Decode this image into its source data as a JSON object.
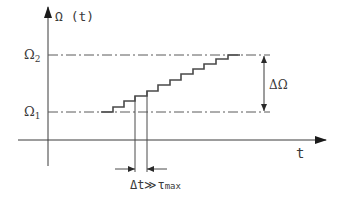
{
  "diagram": {
    "y_axis_label": "Ω (t)",
    "x_axis_label": "t",
    "level_high_label": "Ω",
    "level_high_sub": "2",
    "level_low_label": "Ω",
    "level_low_sub": "1",
    "delta_omega_label": "ΔΩ",
    "delta_t_label": "Δt≫τ",
    "delta_t_sub": "max",
    "staircase_steps": 11,
    "colors": {
      "line": "#3a3a3a",
      "dash": "#5a5a5a",
      "staircase": "#4a4a4a"
    }
  }
}
